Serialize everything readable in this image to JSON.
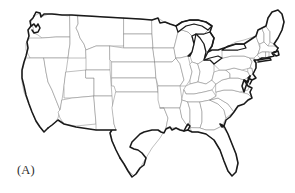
{
  "figure": {
    "panel_label": "(A)",
    "background_color": "#ffffff",
    "nation_border_color": "#1a1a1a",
    "state_border_color": "#8a8a8a",
    "label_color": "#2b2b2b",
    "fill_color": "#ffffff",
    "caption": "",
    "title": ""
  },
  "map": {
    "projection_hint": "albers-equal-area-conic",
    "region_name": "Contiguous United States",
    "includes_great_lakes": true,
    "state_count": 49,
    "shown_features": [
      "national-outline",
      "state-boundaries",
      "great-lakes",
      "florida-peninsula",
      "chesapeake-bay",
      "cape-cod",
      "long-island",
      "gulf-coast",
      "pacific-coast",
      "atlantic-coast",
      "canadian-border",
      "mexican-border"
    ],
    "states": [
      {
        "code": "WA",
        "name": "Washington"
      },
      {
        "code": "OR",
        "name": "Oregon"
      },
      {
        "code": "CA",
        "name": "California"
      },
      {
        "code": "NV",
        "name": "Nevada"
      },
      {
        "code": "ID",
        "name": "Idaho"
      },
      {
        "code": "MT",
        "name": "Montana"
      },
      {
        "code": "WY",
        "name": "Wyoming"
      },
      {
        "code": "UT",
        "name": "Utah"
      },
      {
        "code": "AZ",
        "name": "Arizona"
      },
      {
        "code": "CO",
        "name": "Colorado"
      },
      {
        "code": "NM",
        "name": "New Mexico"
      },
      {
        "code": "ND",
        "name": "North Dakota"
      },
      {
        "code": "SD",
        "name": "South Dakota"
      },
      {
        "code": "NE",
        "name": "Nebraska"
      },
      {
        "code": "KS",
        "name": "Kansas"
      },
      {
        "code": "OK",
        "name": "Oklahoma"
      },
      {
        "code": "TX",
        "name": "Texas"
      },
      {
        "code": "MN",
        "name": "Minnesota"
      },
      {
        "code": "IA",
        "name": "Iowa"
      },
      {
        "code": "MO",
        "name": "Missouri"
      },
      {
        "code": "AR",
        "name": "Arkansas"
      },
      {
        "code": "LA",
        "name": "Louisiana"
      },
      {
        "code": "WI",
        "name": "Wisconsin"
      },
      {
        "code": "IL",
        "name": "Illinois"
      },
      {
        "code": "MI",
        "name": "Michigan"
      },
      {
        "code": "IN",
        "name": "Indiana"
      },
      {
        "code": "OH",
        "name": "Ohio"
      },
      {
        "code": "KY",
        "name": "Kentucky"
      },
      {
        "code": "TN",
        "name": "Tennessee"
      },
      {
        "code": "MS",
        "name": "Mississippi"
      },
      {
        "code": "AL",
        "name": "Alabama"
      },
      {
        "code": "GA",
        "name": "Georgia"
      },
      {
        "code": "FL",
        "name": "Florida"
      },
      {
        "code": "SC",
        "name": "South Carolina"
      },
      {
        "code": "NC",
        "name": "North Carolina"
      },
      {
        "code": "VA",
        "name": "Virginia"
      },
      {
        "code": "WV",
        "name": "West Virginia"
      },
      {
        "code": "MD",
        "name": "Maryland"
      },
      {
        "code": "DE",
        "name": "Delaware"
      },
      {
        "code": "PA",
        "name": "Pennsylvania"
      },
      {
        "code": "NJ",
        "name": "New Jersey"
      },
      {
        "code": "NY",
        "name": "New York"
      },
      {
        "code": "CT",
        "name": "Connecticut"
      },
      {
        "code": "RI",
        "name": "Rhode Island"
      },
      {
        "code": "MA",
        "name": "Massachusetts"
      },
      {
        "code": "VT",
        "name": "Vermont"
      },
      {
        "code": "NH",
        "name": "New Hampshire"
      },
      {
        "code": "ME",
        "name": "Maine"
      },
      {
        "code": "DC",
        "name": "District of Columbia"
      }
    ],
    "lakes": [
      {
        "name": "Lake Superior"
      },
      {
        "name": "Lake Michigan"
      },
      {
        "name": "Lake Huron"
      },
      {
        "name": "Lake Erie"
      },
      {
        "name": "Lake Ontario"
      }
    ]
  }
}
